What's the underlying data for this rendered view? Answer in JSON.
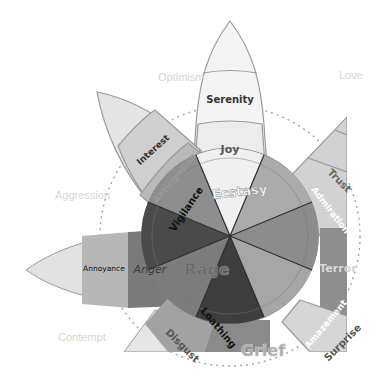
{
  "center": {
    "x": 230,
    "y": 236
  },
  "colors": {
    "background": "#ffffff",
    "outline": "#8a8a8a",
    "dash": "#9a9a9a",
    "dyad_text": "#d6d6d6"
  },
  "dyads": [
    {
      "label": "Optimism",
      "x": 160,
      "y": 78
    },
    {
      "label": "Love",
      "x": 340,
      "y": 76
    },
    {
      "label": "Aggression",
      "x": 68,
      "y": 196
    },
    {
      "label": "Contempt",
      "x": 84,
      "y": 337
    }
  ],
  "petals": {
    "joy": {
      "outer": "Serenity",
      "middle": "Joy",
      "inner": "Ecstasy"
    },
    "trust": {
      "middle": "Trust",
      "inner": "Admiration"
    },
    "fear": {
      "inner": "Terror"
    },
    "surprise": {
      "middle": "Surprise",
      "inner": "Amazement"
    },
    "sadness": {
      "inner": "Grief"
    },
    "disgust": {
      "middle": "Disgust",
      "inner": "Loathing"
    },
    "anger": {
      "outer": "Annoyance",
      "middle": "Anger",
      "inner": "Rage"
    },
    "anticipation": {
      "outer": "Interest",
      "middle": "Anticipation",
      "inner": "Vigilance"
    }
  }
}
